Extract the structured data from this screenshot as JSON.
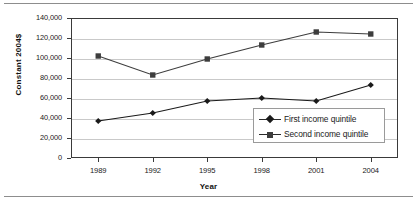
{
  "chart_data": {
    "type": "line",
    "title": "",
    "xlabel": "Year",
    "ylabel": "Constant  2004$",
    "categories": [
      "1989",
      "1992",
      "1995",
      "1998",
      "2001",
      "2004"
    ],
    "x": [
      1989,
      1992,
      1995,
      1998,
      2001,
      2004
    ],
    "series": [
      {
        "name": "First income quintile",
        "marker": "diamond",
        "color": "#1a1a1a",
        "values": [
          37000,
          45000,
          57000,
          60000,
          57000,
          73000
        ]
      },
      {
        "name": "Second income quintile",
        "marker": "square",
        "color": "#3d3d3d",
        "values": [
          102000,
          83000,
          99000,
          113000,
          126000,
          124000
        ]
      }
    ],
    "ylim": [
      0,
      140000
    ],
    "ytick_values": [
      0,
      20000,
      40000,
      60000,
      80000,
      100000,
      120000,
      140000
    ],
    "ytick_labels": [
      "0",
      "20,000",
      "40,000",
      "60,000",
      "80,000",
      "100,000",
      "120,000",
      "140,000"
    ],
    "grid": true,
    "legend_position": "inside-right-lower"
  },
  "legend": {
    "entries": [
      {
        "label": "First income quintile",
        "marker": "diamond-marker-icon"
      },
      {
        "label": "Second income quintile",
        "marker": "square-marker-icon"
      }
    ]
  },
  "colors": {
    "gridline": "#c9c9c9",
    "axis": "#3a3a3a",
    "series_first": "#1a1a1a",
    "series_second": "#3d3d3d",
    "rule": "#8d8d8d"
  }
}
